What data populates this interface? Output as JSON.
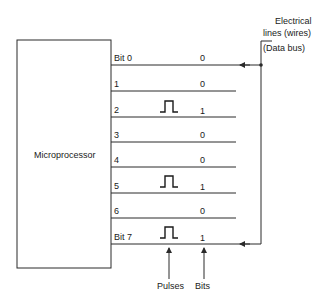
{
  "processor": {
    "label": "Microprocessor"
  },
  "bus": {
    "label_line1": "Electrical",
    "label_line2": "lines (wires)",
    "label_line3": "(Data bus)"
  },
  "lines": [
    {
      "name": "Bit 0",
      "value": "0",
      "pulse": false
    },
    {
      "name": "1",
      "value": "0",
      "pulse": false
    },
    {
      "name": "2",
      "value": "1",
      "pulse": true
    },
    {
      "name": "3",
      "value": "0",
      "pulse": false
    },
    {
      "name": "4",
      "value": "0",
      "pulse": false
    },
    {
      "name": "5",
      "value": "1",
      "pulse": true
    },
    {
      "name": "6",
      "value": "0",
      "pulse": false
    },
    {
      "name": "Bit 7",
      "value": "1",
      "pulse": true
    }
  ],
  "annotations": {
    "pulses": "Pulses",
    "bits": "Bits"
  },
  "colors": {
    "line": "#2a2a2a",
    "background": "#ffffff"
  }
}
